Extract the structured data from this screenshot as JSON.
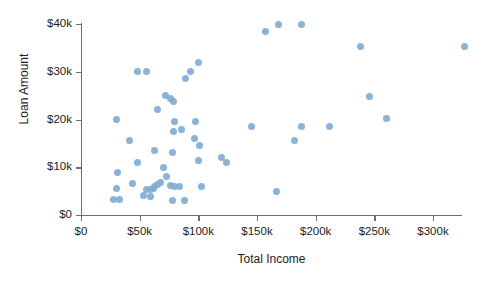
{
  "chart_data": {
    "type": "scatter",
    "title": "",
    "xlabel": "Total Income",
    "ylabel": "Loan Amount",
    "xlim": [
      0,
      330000
    ],
    "ylim": [
      0,
      41000
    ],
    "grid": false,
    "legend": null,
    "marker_color": "#7fadd4",
    "axis_color": "#6e6e6e",
    "xticks": [
      0,
      50000,
      100000,
      150000,
      200000,
      250000,
      300000
    ],
    "xticklabels": [
      "$0",
      "$50k",
      "$100k",
      "$150k",
      "$200k",
      "$250k",
      "$300k"
    ],
    "yticks": [
      0,
      10000,
      20000,
      30000,
      40000
    ],
    "yticklabels": [
      "$0",
      "$10k",
      "$20k",
      "$30k",
      "$40k"
    ],
    "points": [
      {
        "x": 28000,
        "y": 3300
      },
      {
        "x": 32500,
        "y": 3300
      },
      {
        "x": 31000,
        "y": 9000
      },
      {
        "x": 30000,
        "y": 5500
      },
      {
        "x": 30000,
        "y": 20000
      },
      {
        "x": 43500,
        "y": 6500
      },
      {
        "x": 41000,
        "y": 15500
      },
      {
        "x": 48000,
        "y": 30000
      },
      {
        "x": 56000,
        "y": 30000
      },
      {
        "x": 48000,
        "y": 11000
      },
      {
        "x": 56000,
        "y": 5400
      },
      {
        "x": 59000,
        "y": 5400
      },
      {
        "x": 53000,
        "y": 4000
      },
      {
        "x": 59000,
        "y": 3900
      },
      {
        "x": 62000,
        "y": 5500
      },
      {
        "x": 63000,
        "y": 6000
      },
      {
        "x": 65000,
        "y": 6300
      },
      {
        "x": 68000,
        "y": 6800
      },
      {
        "x": 65000,
        "y": 22000
      },
      {
        "x": 63000,
        "y": 13500
      },
      {
        "x": 70000,
        "y": 10000
      },
      {
        "x": 72000,
        "y": 25000
      },
      {
        "x": 76000,
        "y": 24500
      },
      {
        "x": 79000,
        "y": 23800
      },
      {
        "x": 80000,
        "y": 19500
      },
      {
        "x": 79000,
        "y": 17500
      },
      {
        "x": 78000,
        "y": 13000
      },
      {
        "x": 73000,
        "y": 8000
      },
      {
        "x": 76000,
        "y": 6200
      },
      {
        "x": 80000,
        "y": 6000
      },
      {
        "x": 84000,
        "y": 6000
      },
      {
        "x": 78000,
        "y": 3100
      },
      {
        "x": 88000,
        "y": 3100
      },
      {
        "x": 86000,
        "y": 18000
      },
      {
        "x": 89000,
        "y": 28500
      },
      {
        "x": 93000,
        "y": 30000
      },
      {
        "x": 100000,
        "y": 32000
      },
      {
        "x": 98000,
        "y": 19500
      },
      {
        "x": 97000,
        "y": 16000
      },
      {
        "x": 101000,
        "y": 14500
      },
      {
        "x": 100000,
        "y": 11500
      },
      {
        "x": 103000,
        "y": 6000
      },
      {
        "x": 120000,
        "y": 12000
      },
      {
        "x": 124000,
        "y": 11000
      },
      {
        "x": 145000,
        "y": 18500
      },
      {
        "x": 157000,
        "y": 38500
      },
      {
        "x": 167000,
        "y": 5000
      },
      {
        "x": 168000,
        "y": 40000
      },
      {
        "x": 188000,
        "y": 40000
      },
      {
        "x": 182000,
        "y": 15500
      },
      {
        "x": 188000,
        "y": 18500
      },
      {
        "x": 212000,
        "y": 18500
      },
      {
        "x": 238000,
        "y": 35300
      },
      {
        "x": 246000,
        "y": 24800
      },
      {
        "x": 260000,
        "y": 20200
      },
      {
        "x": 327000,
        "y": 35200
      }
    ]
  }
}
